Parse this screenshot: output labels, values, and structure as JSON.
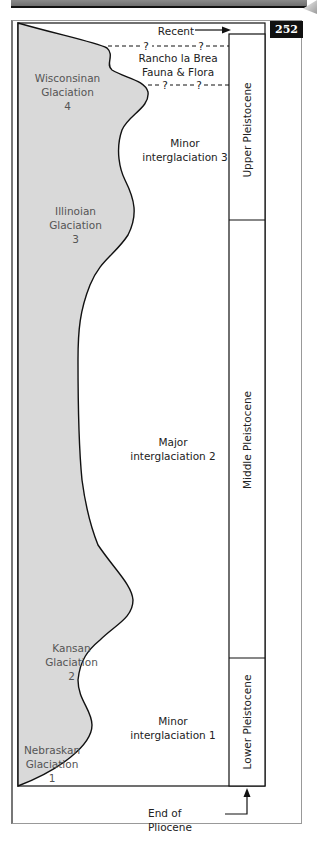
{
  "page_number": "252",
  "diagram": {
    "top_marker": "Recent",
    "bottom_marker": "End of Pliocene",
    "rancho_label": [
      "Rancho la Brea",
      "Fauna & Flora"
    ],
    "uncertain_marker": "?",
    "glaciations": [
      {
        "name": "Wisconsinan",
        "line2": "Glaciation",
        "number": "4"
      },
      {
        "name": "Illinoian",
        "line2": "Glaciation",
        "number": "3"
      },
      {
        "name": "Kansan",
        "line2": "Glaciation",
        "number": "2"
      },
      {
        "name": "Nebraskan",
        "line2": "Glaciation",
        "number": "1"
      }
    ],
    "interglaciations": [
      {
        "line1": "Minor",
        "line2": "interglaciation 3"
      },
      {
        "line1": "Major",
        "line2": "interglaciation 2"
      },
      {
        "line1": "Minor",
        "line2": "interglaciation 1"
      }
    ],
    "epochs": [
      {
        "label": "Upper Pleistocene"
      },
      {
        "label": "Middle Pleistocene"
      },
      {
        "label": "Lower Pleistocene"
      }
    ]
  },
  "colors": {
    "ice_fill": "#d9d9d9",
    "outline": "#111111",
    "badge_bg": "#111111",
    "glaciation_text": "#555555"
  }
}
